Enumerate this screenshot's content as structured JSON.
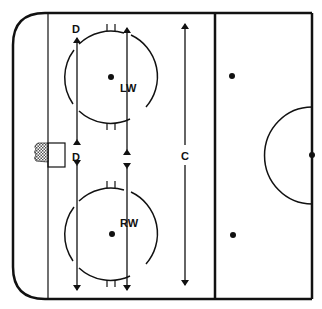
{
  "diagram": {
    "type": "hockey-rink-half",
    "colors": {
      "line": "#111111",
      "background": "#ffffff",
      "net": "#888888"
    },
    "labels": {
      "defense_top": "D",
      "defense_bottom": "D",
      "left_wing": "LW",
      "right_wing": "RW",
      "center": "C"
    },
    "elements": {
      "faceoff_circles": [
        {
          "name": "top",
          "cx": 111,
          "cy": 77,
          "r": 46
        },
        {
          "name": "bottom",
          "cx": 111,
          "cy": 234,
          "r": 46
        }
      ],
      "neutral_dots": [
        {
          "cx": 232,
          "cy": 76
        },
        {
          "cx": 233,
          "cy": 235
        }
      ],
      "center_dot": {
        "cx": 312,
        "cy": 155
      }
    }
  }
}
